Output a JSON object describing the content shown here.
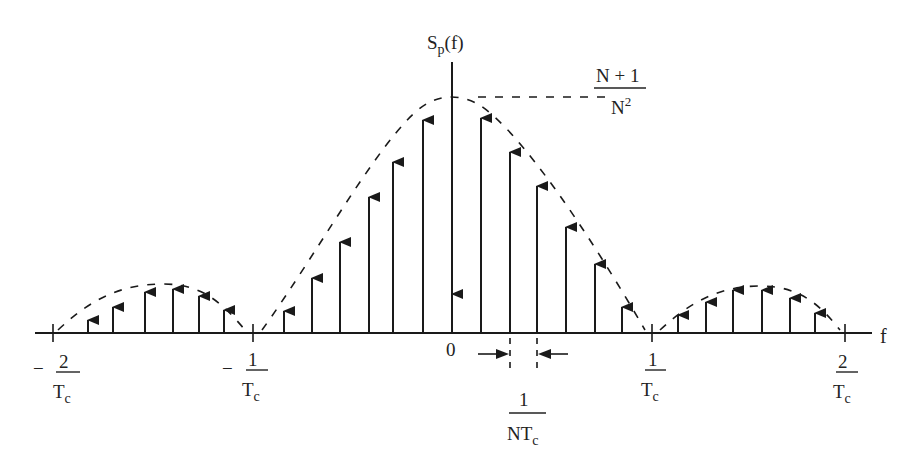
{
  "y_label": {
    "main": "S",
    "sub": "p",
    "rest": "(f)"
  },
  "x_label": "f",
  "peak_label": {
    "numerator": "N + 1",
    "denominator_base": "N",
    "denominator_sup": "2"
  },
  "ticks": [
    {
      "sign": "−",
      "numerator": "2",
      "denominator_base": "T",
      "denominator_sub": "c",
      "x": 53
    },
    {
      "sign": "−",
      "numerator": "1",
      "denominator_base": "T",
      "denominator_sub": "c",
      "x": 253
    },
    {
      "sign": "",
      "numerator": "0",
      "x": 452
    },
    {
      "sign": "",
      "numerator": "1",
      "denominator_base": "T",
      "denominator_sub": "c",
      "x": 652
    },
    {
      "sign": "",
      "numerator": "2",
      "denominator_base": "T",
      "denominator_sub": "c",
      "x": 845
    }
  ],
  "spacing_label": {
    "numerator": "1",
    "denominator_base": "NT",
    "denominator_sub": "c"
  },
  "colors": {
    "ink": "#1a1a1a",
    "background": "#ffffff"
  },
  "chart_data": {
    "type": "stem",
    "xlabel": "f",
    "ylabel": "S_p(f)",
    "peak_value": "(N+1)/N^2",
    "line_spacing": "1/(N T_c)",
    "envelope": "sinc^2 (dashed)",
    "x_ticks": [
      "-2/T_c",
      "-1/T_c",
      "0",
      "1/T_c",
      "2/T_c"
    ],
    "impulses": [
      {
        "x_px": 88,
        "top_px": 318
      },
      {
        "x_px": 113,
        "top_px": 305
      },
      {
        "x_px": 145,
        "top_px": 290
      },
      {
        "x_px": 173,
        "top_px": 287
      },
      {
        "x_px": 199,
        "top_px": 294
      },
      {
        "x_px": 224,
        "top_px": 308
      },
      {
        "x_px": 284,
        "top_px": 309
      },
      {
        "x_px": 312,
        "top_px": 276
      },
      {
        "x_px": 340,
        "top_px": 240
      },
      {
        "x_px": 369,
        "top_px": 195
      },
      {
        "x_px": 393,
        "top_px": 160
      },
      {
        "x_px": 423,
        "top_px": 118
      },
      {
        "x_px": 452,
        "top_px": 292,
        "dc": true
      },
      {
        "x_px": 481,
        "top_px": 116
      },
      {
        "x_px": 510,
        "top_px": 150
      },
      {
        "x_px": 537,
        "top_px": 184
      },
      {
        "x_px": 566,
        "top_px": 225
      },
      {
        "x_px": 595,
        "top_px": 262
      },
      {
        "x_px": 622,
        "top_px": 305
      },
      {
        "x_px": 678,
        "top_px": 313
      },
      {
        "x_px": 706,
        "top_px": 300
      },
      {
        "x_px": 733,
        "top_px": 288
      },
      {
        "x_px": 762,
        "top_px": 288
      },
      {
        "x_px": 790,
        "top_px": 296
      },
      {
        "x_px": 815,
        "top_px": 311
      }
    ],
    "grid": false,
    "legend": null
  }
}
